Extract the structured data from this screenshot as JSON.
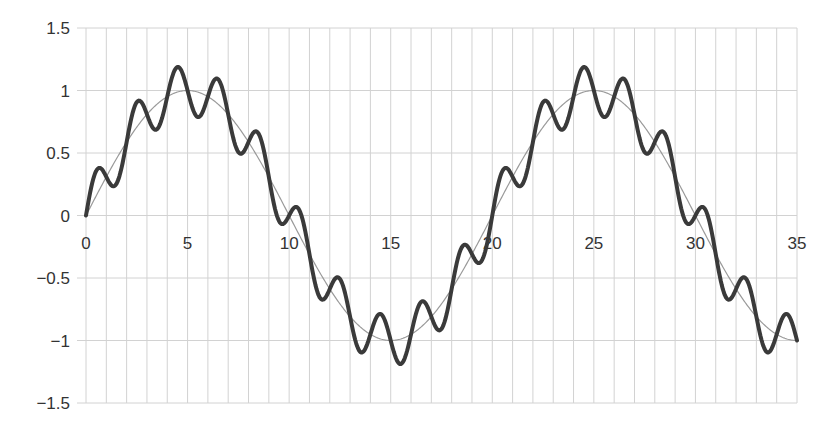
{
  "chart_data": {
    "type": "line",
    "title": "",
    "xlabel": "",
    "ylabel": "",
    "xlim": [
      0,
      35
    ],
    "ylim": [
      -1.5,
      1.5
    ],
    "grid": true,
    "legend": null,
    "x_ticks": [
      0,
      5,
      10,
      15,
      20,
      25,
      30,
      35
    ],
    "x_tick_labels": [
      "0",
      "5",
      "10",
      "15",
      "20",
      "25",
      "30",
      "35"
    ],
    "x_minor_gridlines_step": 1,
    "y_ticks": [
      1.5,
      1,
      0.5,
      0,
      -0.5,
      -1,
      -1.5
    ],
    "y_tick_labels": [
      "1.5",
      "1",
      "0.5",
      "0",
      "−0.5",
      "−1",
      "−1.5"
    ],
    "series": [
      {
        "name": "fundamental",
        "description": "sin(2πx/20)",
        "style": "thin",
        "color": "#9a9a9a",
        "x": [
          0,
          1,
          2,
          3,
          4,
          5,
          6,
          7,
          8,
          9,
          10,
          11,
          12,
          13,
          14,
          15,
          16,
          17,
          18,
          19,
          20,
          21,
          22,
          23,
          24,
          25,
          26,
          27,
          28,
          29,
          30,
          31,
          32,
          33,
          34,
          35
        ],
        "values": [
          0,
          0.31,
          0.59,
          0.81,
          0.95,
          1,
          0.95,
          0.81,
          0.59,
          0.31,
          0,
          -0.31,
          -0.59,
          -0.81,
          -0.95,
          -1,
          -0.95,
          -0.81,
          -0.59,
          -0.31,
          0,
          0.31,
          0.59,
          0.81,
          0.95,
          1,
          0.95,
          0.81,
          0.59,
          0.31,
          0,
          -0.31,
          -0.59,
          -0.81,
          -0.95,
          -1
        ]
      },
      {
        "name": "fundamental + harmonic",
        "description": "sin(2πx/20) + 0.2·sin(πx)",
        "style": "thick",
        "color": "#3a3a3a",
        "x": [
          0,
          0.5,
          1.5,
          2.5,
          3.5,
          4.5,
          5.5,
          6.5,
          7.5,
          8.5,
          9.5,
          10.5,
          11.5,
          12.5,
          13.5,
          14.5,
          15.5,
          16.5,
          17.5,
          18.5,
          19.5,
          20.5,
          21.5,
          22.5,
          23.5,
          24.5,
          25.5,
          26.5,
          27.5,
          28.5,
          29.5,
          30.5,
          31.5,
          32.5,
          33.5,
          34.5,
          35
        ],
        "values": [
          0,
          0.36,
          0.25,
          0.91,
          0.69,
          1.19,
          0.79,
          1.09,
          0.51,
          0.65,
          -0.04,
          0.04,
          -0.65,
          -0.51,
          -1.09,
          -0.79,
          -1.19,
          -0.69,
          -0.91,
          -0.25,
          -0.36,
          0.36,
          0.25,
          0.91,
          0.69,
          1.19,
          0.79,
          1.09,
          0.51,
          0.65,
          -0.04,
          0.04,
          -0.65,
          -0.51,
          -1.09,
          -0.79,
          -1
        ]
      }
    ],
    "formulas": {
      "thin": {
        "amp1": 1,
        "period1": 20,
        "amp2": 0,
        "period2": 2
      },
      "thick": {
        "amp1": 1,
        "period1": 20,
        "amp2": 0.2,
        "period2": 2
      }
    }
  },
  "layout": {
    "x0_px": 86,
    "x1_px": 797,
    "y_top_px": 28,
    "y_bottom_px": 403,
    "grid_left_px": 77,
    "grid_color": "#d2d2d2",
    "thin_color": "#9a9a9a",
    "thick_color": "#3a3a3a"
  }
}
